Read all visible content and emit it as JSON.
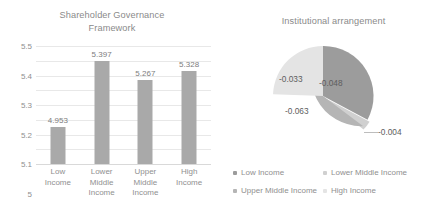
{
  "chart_data": [
    {
      "type": "bar",
      "title": "Shareholder Governance Framework",
      "xlabel": "",
      "ylabel": "",
      "ylim": [
        4.7,
        5.5
      ],
      "ytick_step": 0.1,
      "grid": true,
      "legend": "none",
      "categories": [
        "Low Income",
        "Lower Middle Income",
        "Upper Middle Income",
        "High Income"
      ],
      "category_lines": [
        [
          "Low",
          "Income"
        ],
        [
          "Lower",
          "Middle",
          "Income"
        ],
        [
          "Upper",
          "Middle",
          "Income"
        ],
        [
          "High",
          "Income"
        ]
      ],
      "values": [
        4.953,
        5.397,
        5.267,
        5.328
      ],
      "value_labels": [
        "4.953",
        "5.397",
        "5.267",
        "5.328"
      ],
      "ytick_labels": [
        "5.5",
        "5.4",
        "5.3",
        "5.2",
        "5.1",
        "5",
        "4.9",
        "4.8",
        "4.7"
      ],
      "bar_color": "#a9a9a9"
    },
    {
      "type": "pie",
      "title": "Institutional arrangement",
      "legend": "bottom",
      "labels": [
        "Low Income",
        "Lower Middle Income",
        "Upper Middle Income",
        "High Income"
      ],
      "values": [
        -0.048,
        -0.004,
        -0.063,
        -0.033
      ],
      "value_labels": [
        "-0.048",
        "-0.004",
        "-0.063",
        "-0.033"
      ],
      "slice_colors": [
        "#9c9c9c",
        "#d0d0d0",
        "#b5b5b5",
        "#e4e4e4"
      ]
    }
  ],
  "bar_chart": {
    "title_line1": "Shareholder Governance",
    "title_line2": "Framework"
  },
  "pie_chart": {
    "title": "Institutional arrangement",
    "labels": {
      "low": "-0.048",
      "lower_middle": "-0.004",
      "upper_middle": "-0.063",
      "high": "-0.033"
    },
    "legend": [
      {
        "label": "Low Income",
        "color": "#9c9c9c"
      },
      {
        "label": "Lower Middle Income",
        "color": "#d0d0d0"
      },
      {
        "label": "Upper Middle Income",
        "color": "#b5b5b5"
      },
      {
        "label": "High Income",
        "color": "#e4e4e4"
      }
    ]
  }
}
